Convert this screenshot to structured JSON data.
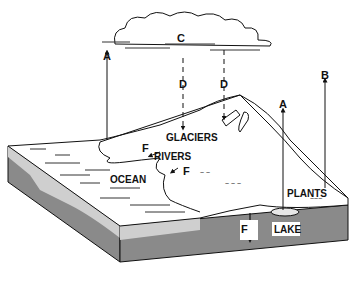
{
  "diagram": {
    "labels": {
      "a_left": "A",
      "a_right": "A",
      "b": "B",
      "c": "C",
      "d_left": "D",
      "d_right": "D",
      "f_glacier": "F",
      "f_river": "F",
      "f_lake": "F",
      "glaciers": "GLACIERS",
      "rivers": "RIVERS",
      "ocean": "OCEAN",
      "plants": "PLANTS",
      "lake": "LAKE"
    },
    "colors": {
      "line": "#111111",
      "top_surface": "#ffffff",
      "light_layer": "#cfcfcf",
      "dark_layer": "#8a8a8a",
      "lake_fill": "#e6e6e6"
    }
  }
}
